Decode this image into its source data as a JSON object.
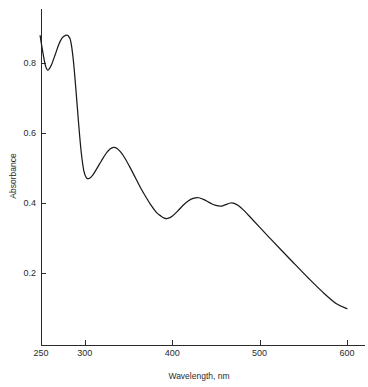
{
  "chart_data": {
    "type": "line",
    "title": "",
    "subtitle": "",
    "xlabel": "Wavelength, nm",
    "ylabel": "Absorbance",
    "xlim": [
      238,
      612
    ],
    "ylim": [
      0.0,
      0.93
    ],
    "grid": false,
    "legend": null,
    "legend_position": "none",
    "xticks": [
      250,
      300,
      400,
      500,
      600
    ],
    "xtick_labels": [
      "250",
      "300",
      "400",
      "500",
      "600"
    ],
    "yticks": [
      0.2,
      0.4,
      0.6,
      0.8
    ],
    "ytick_labels": [
      "0.2",
      "0.4",
      "0.6",
      "0.8"
    ],
    "series": [
      {
        "name": "absorbance-spectrum",
        "color": "#1b1b1b",
        "x": [
          249,
          252,
          255,
          257,
          259,
          262,
          266,
          270,
          274,
          278,
          281,
          284,
          287,
          290,
          293,
          296,
          299,
          302,
          305,
          309,
          314,
          319,
          324,
          329,
          333,
          337,
          341,
          346,
          352,
          358,
          364,
          370,
          376,
          382,
          387,
          391,
          395,
          400,
          406,
          412,
          418,
          424,
          430,
          435,
          440,
          445,
          450,
          455,
          459,
          463,
          467,
          471,
          476,
          482,
          490,
          500,
          512,
          525,
          540,
          556,
          572,
          588,
          600
        ],
        "y": [
          0.878,
          0.832,
          0.793,
          0.781,
          0.782,
          0.795,
          0.822,
          0.851,
          0.871,
          0.879,
          0.878,
          0.862,
          0.808,
          0.722,
          0.628,
          0.545,
          0.492,
          0.472,
          0.47,
          0.479,
          0.499,
          0.52,
          0.54,
          0.554,
          0.559,
          0.556,
          0.546,
          0.528,
          0.501,
          0.472,
          0.443,
          0.417,
          0.393,
          0.373,
          0.363,
          0.357,
          0.356,
          0.362,
          0.376,
          0.392,
          0.405,
          0.413,
          0.415,
          0.411,
          0.405,
          0.398,
          0.393,
          0.391,
          0.393,
          0.397,
          0.4,
          0.399,
          0.392,
          0.379,
          0.358,
          0.331,
          0.299,
          0.265,
          0.226,
          0.185,
          0.146,
          0.112,
          0.098
        ]
      }
    ],
    "annotations": []
  },
  "axis": {
    "y_title": "Absorbance",
    "x_title": "Wavelength, nm"
  }
}
